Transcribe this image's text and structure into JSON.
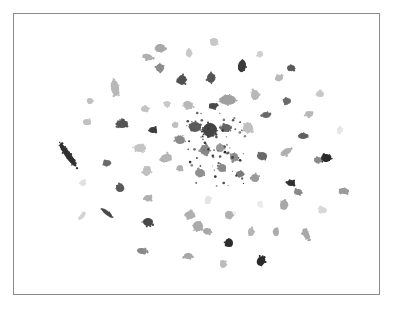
{
  "chart_data": {
    "type": "scatter",
    "title": "",
    "xlabel": "",
    "ylabel": "",
    "axes_visible": false,
    "grid": false,
    "legend": null,
    "frame": {
      "x": 13,
      "y": 13,
      "width": 367,
      "height": 282,
      "color": "#8a8a8a"
    },
    "clusters": [
      {
        "x": 160,
        "y": 48,
        "rx": 5,
        "ry": 4,
        "rot": -10,
        "color": "#a8a8a8"
      },
      {
        "x": 214,
        "y": 42,
        "rx": 4,
        "ry": 4,
        "rot": 0,
        "color": "#c8c8c8"
      },
      {
        "x": 148,
        "y": 57,
        "rx": 5,
        "ry": 3,
        "rot": 20,
        "color": "#b0b0b0"
      },
      {
        "x": 189,
        "y": 53,
        "rx": 3,
        "ry": 4,
        "rot": 0,
        "color": "#c8c8c8"
      },
      {
        "x": 160,
        "y": 68,
        "rx": 4,
        "ry": 4,
        "rot": 30,
        "color": "#8c8c8c"
      },
      {
        "x": 242,
        "y": 66,
        "rx": 4,
        "ry": 6,
        "rot": 10,
        "color": "#3a3a3a"
      },
      {
        "x": 182,
        "y": 80,
        "rx": 4,
        "ry": 5,
        "rot": 0,
        "color": "#505050"
      },
      {
        "x": 211,
        "y": 78,
        "rx": 4,
        "ry": 5,
        "rot": 0,
        "color": "#555555"
      },
      {
        "x": 260,
        "y": 54,
        "rx": 3,
        "ry": 3,
        "rot": 0,
        "color": "#d0d0d0"
      },
      {
        "x": 291,
        "y": 68,
        "rx": 4,
        "ry": 3,
        "rot": 0,
        "color": "#5a5a5a"
      },
      {
        "x": 279,
        "y": 78,
        "rx": 4,
        "ry": 3,
        "rot": -20,
        "color": "#b8b8b8"
      },
      {
        "x": 115,
        "y": 88,
        "rx": 4,
        "ry": 8,
        "rot": -10,
        "color": "#b8b8b8"
      },
      {
        "x": 90,
        "y": 101,
        "rx": 3,
        "ry": 3,
        "rot": 0,
        "color": "#c0c0c0"
      },
      {
        "x": 255,
        "y": 95,
        "rx": 4,
        "ry": 5,
        "rot": 0,
        "color": "#b8b8b8"
      },
      {
        "x": 228,
        "y": 100,
        "rx": 8,
        "ry": 5,
        "rot": 0,
        "color": "#a0a0a0"
      },
      {
        "x": 213,
        "y": 106,
        "rx": 4,
        "ry": 3,
        "rot": 0,
        "color": "#4a4a4a"
      },
      {
        "x": 188,
        "y": 105,
        "rx": 5,
        "ry": 4,
        "rot": 20,
        "color": "#b8b8b8"
      },
      {
        "x": 167,
        "y": 104,
        "rx": 3,
        "ry": 3,
        "rot": 0,
        "color": "#c8c8c8"
      },
      {
        "x": 145,
        "y": 109,
        "rx": 4,
        "ry": 3,
        "rot": 0,
        "color": "#c4c4c4"
      },
      {
        "x": 287,
        "y": 101,
        "rx": 4,
        "ry": 3,
        "rot": 0,
        "color": "#6a6a6a"
      },
      {
        "x": 320,
        "y": 94,
        "rx": 4,
        "ry": 3,
        "rot": 0,
        "color": "#c8c8c8"
      },
      {
        "x": 87,
        "y": 122,
        "rx": 4,
        "ry": 3,
        "rot": 0,
        "color": "#c0c0c0"
      },
      {
        "x": 122,
        "y": 124,
        "rx": 6,
        "ry": 4,
        "rot": 0,
        "color": "#555555"
      },
      {
        "x": 153,
        "y": 130,
        "rx": 4,
        "ry": 3,
        "rot": 0,
        "color": "#3c3c3c"
      },
      {
        "x": 175,
        "y": 125,
        "rx": 3,
        "ry": 3,
        "rot": 0,
        "color": "#c0c0c0"
      },
      {
        "x": 195,
        "y": 127,
        "rx": 6,
        "ry": 5,
        "rot": 0,
        "color": "#5a5a5a"
      },
      {
        "x": 210,
        "y": 130,
        "rx": 7,
        "ry": 7,
        "rot": 0,
        "color": "#444444"
      },
      {
        "x": 226,
        "y": 128,
        "rx": 5,
        "ry": 4,
        "rot": 0,
        "color": "#666666"
      },
      {
        "x": 248,
        "y": 128,
        "rx": 5,
        "ry": 5,
        "rot": 0,
        "color": "#c0c0c0"
      },
      {
        "x": 266,
        "y": 115,
        "rx": 4,
        "ry": 3,
        "rot": 0,
        "color": "#6a6a6a"
      },
      {
        "x": 303,
        "y": 136,
        "rx": 5,
        "ry": 3,
        "rot": 0,
        "color": "#606060"
      },
      {
        "x": 309,
        "y": 114,
        "rx": 4,
        "ry": 3,
        "rot": 0,
        "color": "#b8b8b8"
      },
      {
        "x": 340,
        "y": 130,
        "rx": 3,
        "ry": 3,
        "rot": 0,
        "color": "#e6e6e6"
      },
      {
        "x": 68,
        "y": 155,
        "rx": 3,
        "ry": 14,
        "rot": -35,
        "color": "#303030"
      },
      {
        "x": 140,
        "y": 148,
        "rx": 6,
        "ry": 4,
        "rot": 0,
        "color": "#c4c4c4"
      },
      {
        "x": 180,
        "y": 140,
        "rx": 5,
        "ry": 4,
        "rot": 0,
        "color": "#8a8a8a"
      },
      {
        "x": 205,
        "y": 150,
        "rx": 5,
        "ry": 5,
        "rot": 0,
        "color": "#888888"
      },
      {
        "x": 220,
        "y": 148,
        "rx": 4,
        "ry": 4,
        "rot": 0,
        "color": "#9a9a9a"
      },
      {
        "x": 234,
        "y": 157,
        "rx": 4,
        "ry": 4,
        "rot": 0,
        "color": "#8c8c8c"
      },
      {
        "x": 262,
        "y": 156,
        "rx": 5,
        "ry": 4,
        "rot": 0,
        "color": "#6a6a6a"
      },
      {
        "x": 286,
        "y": 152,
        "rx": 6,
        "ry": 3,
        "rot": -30,
        "color": "#b0b0b0"
      },
      {
        "x": 318,
        "y": 160,
        "rx": 4,
        "ry": 3,
        "rot": 0,
        "color": "#8a8a8a"
      },
      {
        "x": 326,
        "y": 158,
        "rx": 5,
        "ry": 4,
        "rot": 0,
        "color": "#2a2a2a"
      },
      {
        "x": 107,
        "y": 163,
        "rx": 4,
        "ry": 3,
        "rot": 0,
        "color": "#6a6a6a"
      },
      {
        "x": 166,
        "y": 158,
        "rx": 6,
        "ry": 4,
        "rot": -20,
        "color": "#b4b4b4"
      },
      {
        "x": 147,
        "y": 171,
        "rx": 4,
        "ry": 5,
        "rot": 20,
        "color": "#c0c0c0"
      },
      {
        "x": 180,
        "y": 168,
        "rx": 3,
        "ry": 3,
        "rot": 0,
        "color": "#b0b0b0"
      },
      {
        "x": 200,
        "y": 173,
        "rx": 5,
        "ry": 4,
        "rot": 0,
        "color": "#909090"
      },
      {
        "x": 222,
        "y": 168,
        "rx": 4,
        "ry": 4,
        "rot": 0,
        "color": "#8a8a8a"
      },
      {
        "x": 240,
        "y": 174,
        "rx": 4,
        "ry": 3,
        "rot": 0,
        "color": "#7a7a7a"
      },
      {
        "x": 255,
        "y": 178,
        "rx": 4,
        "ry": 4,
        "rot": 0,
        "color": "#9a9a9a"
      },
      {
        "x": 291,
        "y": 183,
        "rx": 4,
        "ry": 3,
        "rot": 0,
        "color": "#303030"
      },
      {
        "x": 298,
        "y": 192,
        "rx": 4,
        "ry": 3,
        "rot": 0,
        "color": "#8a8a8a"
      },
      {
        "x": 344,
        "y": 191,
        "rx": 5,
        "ry": 3,
        "rot": 10,
        "color": "#9a9a9a"
      },
      {
        "x": 83,
        "y": 183,
        "rx": 3,
        "ry": 3,
        "rot": 0,
        "color": "#e0e0e0"
      },
      {
        "x": 120,
        "y": 188,
        "rx": 4,
        "ry": 4,
        "rot": 0,
        "color": "#5a5a5a"
      },
      {
        "x": 148,
        "y": 198,
        "rx": 4,
        "ry": 3,
        "rot": 0,
        "color": "#b0b0b0"
      },
      {
        "x": 208,
        "y": 200,
        "rx": 3,
        "ry": 4,
        "rot": 0,
        "color": "#e4e4e4"
      },
      {
        "x": 232,
        "y": 214,
        "rx": 3,
        "ry": 3,
        "rot": 0,
        "color": "#ececec"
      },
      {
        "x": 260,
        "y": 204,
        "rx": 3,
        "ry": 3,
        "rot": 0,
        "color": "#ececec"
      },
      {
        "x": 284,
        "y": 205,
        "rx": 4,
        "ry": 5,
        "rot": 0,
        "color": "#a8a8a8"
      },
      {
        "x": 323,
        "y": 210,
        "rx": 4,
        "ry": 3,
        "rot": 20,
        "color": "#d8d8d8"
      },
      {
        "x": 107,
        "y": 213,
        "rx": 2,
        "ry": 7,
        "rot": -50,
        "color": "#4a4a4a"
      },
      {
        "x": 82,
        "y": 216,
        "rx": 2,
        "ry": 5,
        "rot": 40,
        "color": "#d4d4d4"
      },
      {
        "x": 148,
        "y": 222,
        "rx": 5,
        "ry": 4,
        "rot": 0,
        "color": "#4a4a4a"
      },
      {
        "x": 190,
        "y": 215,
        "rx": 5,
        "ry": 4,
        "rot": 0,
        "color": "#b0b0b0"
      },
      {
        "x": 198,
        "y": 226,
        "rx": 5,
        "ry": 5,
        "rot": 30,
        "color": "#aaaaaa"
      },
      {
        "x": 207,
        "y": 231,
        "rx": 4,
        "ry": 3,
        "rot": 0,
        "color": "#a8a8a8"
      },
      {
        "x": 229,
        "y": 215,
        "rx": 4,
        "ry": 4,
        "rot": 0,
        "color": "#b0b0b0"
      },
      {
        "x": 251,
        "y": 232,
        "rx": 3,
        "ry": 4,
        "rot": 0,
        "color": "#b4b4b4"
      },
      {
        "x": 276,
        "y": 232,
        "rx": 3,
        "ry": 4,
        "rot": 0,
        "color": "#acacac"
      },
      {
        "x": 306,
        "y": 234,
        "rx": 3,
        "ry": 6,
        "rot": -25,
        "color": "#a8a8a8"
      },
      {
        "x": 229,
        "y": 243,
        "rx": 4,
        "ry": 4,
        "rot": 0,
        "color": "#2e2e2e"
      },
      {
        "x": 142,
        "y": 251,
        "rx": 5,
        "ry": 3,
        "rot": 10,
        "color": "#8a8a8a"
      },
      {
        "x": 188,
        "y": 256,
        "rx": 4,
        "ry": 3,
        "rot": 0,
        "color": "#a8a8a8"
      },
      {
        "x": 223,
        "y": 264,
        "rx": 3,
        "ry": 4,
        "rot": 0,
        "color": "#bcbcbc"
      },
      {
        "x": 261,
        "y": 261,
        "rx": 4,
        "ry": 5,
        "rot": 30,
        "color": "#2a2a2a"
      }
    ]
  }
}
